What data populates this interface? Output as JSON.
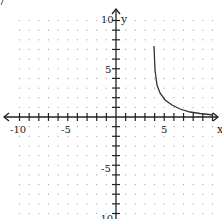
{
  "chart_data": {
    "type": "line",
    "title": "",
    "xlabel": "x",
    "ylabel": "y",
    "xlim": [
      -10,
      10
    ],
    "ylim": [
      -10,
      10
    ],
    "grid": "dotted",
    "x_tick_labels": [
      {
        "value": -10,
        "label": "-10"
      },
      {
        "value": -5,
        "label": "-5"
      },
      {
        "value": 5,
        "label": "5"
      }
    ],
    "y_tick_labels": [
      {
        "value": 10,
        "label": "10"
      },
      {
        "value": 5,
        "label": "5"
      },
      {
        "value": -5,
        "label": "-5"
      },
      {
        "value": -10,
        "label": "-10"
      }
    ],
    "series": [
      {
        "name": "curve",
        "x": [
          3.94,
          4.04,
          4.25,
          4.56,
          5.08,
          5.8,
          6.63,
          7.67,
          8.7,
          10.05
        ],
        "y": [
          7.36,
          4.87,
          3.32,
          2.49,
          1.76,
          1.24,
          0.83,
          0.52,
          0.36,
          0.21
        ]
      }
    ]
  },
  "labels": {
    "x_axis": "x",
    "y_axis": "y",
    "x_tick_m10": "-10",
    "x_tick_m5": "-5",
    "x_tick_5": "5",
    "y_tick_10": "10",
    "y_tick_5": "5",
    "y_tick_m5": "-5",
    "y_tick_m10": "-10"
  }
}
